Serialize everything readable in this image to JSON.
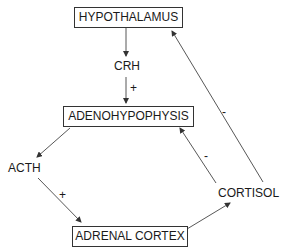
{
  "diagram": {
    "nodes": {
      "hypothalamus": "HYPOTHALAMUS",
      "adenohypophysis": "ADENOHYPOPHYSIS",
      "adrenal_cortex": "ADRENAL CORTEX"
    },
    "hormones": {
      "crh": "CRH",
      "acth": "ACTH",
      "cortisol": "CORTISOL"
    },
    "edges": [
      {
        "from": "HYPOTHALAMUS",
        "to": "CRH",
        "sign": ""
      },
      {
        "from": "CRH",
        "to": "ADENOHYPOPHYSIS",
        "sign": "+"
      },
      {
        "from": "ADENOHYPOPHYSIS",
        "to": "ACTH",
        "sign": ""
      },
      {
        "from": "ACTH",
        "to": "ADRENAL CORTEX",
        "sign": "+"
      },
      {
        "from": "ADRENAL CORTEX",
        "to": "CORTISOL",
        "sign": ""
      },
      {
        "from": "CORTISOL",
        "to": "ADENOHYPOPHYSIS",
        "sign": "-"
      },
      {
        "from": "CORTISOL",
        "to": "HYPOTHALAMUS",
        "sign": "-"
      }
    ],
    "signs": {
      "crh_plus": "+",
      "acth_plus": "+",
      "cortisol_adeno_minus": "-",
      "cortisol_hypo_minus": "-"
    }
  }
}
